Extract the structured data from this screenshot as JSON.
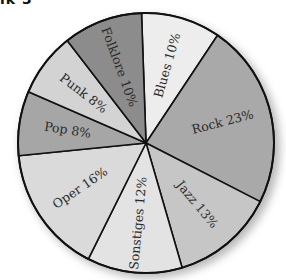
{
  "heading_fragment": "ik 3",
  "chart_data": {
    "type": "pie",
    "title": "",
    "start": "top",
    "direction": "clockwise",
    "slices": [
      {
        "label": "Blues",
        "value": 10,
        "text": "Blues 10%",
        "color": "#ededed"
      },
      {
        "label": "Rock",
        "value": 23,
        "text": "Rock 23%",
        "color": "#a9a9a9"
      },
      {
        "label": "Jazz",
        "value": 13,
        "text": "Jazz 13%",
        "color": "#c6c6c6"
      },
      {
        "label": "Sonstiges",
        "value": 12,
        "text": "Sonstiges 12%",
        "color": "#e3e3e3"
      },
      {
        "label": "Oper",
        "value": 16,
        "text": "Oper 16%",
        "color": "#dadada"
      },
      {
        "label": "Pop",
        "value": 8,
        "text": "Pop 8%",
        "color": "#a6a6a6"
      },
      {
        "label": "Punk",
        "value": 8,
        "text": "Punk 8%",
        "color": "#d3d3d3"
      },
      {
        "label": "Folklore",
        "value": 10,
        "text": "Folklore 10%",
        "color": "#8c8c8c"
      }
    ]
  }
}
